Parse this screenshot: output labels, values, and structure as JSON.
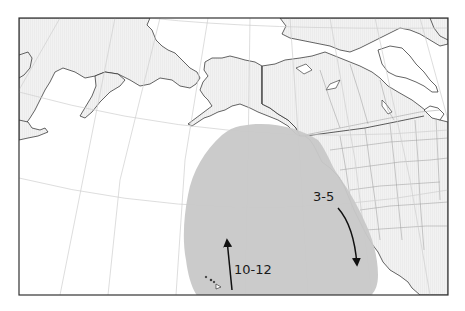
{
  "map": {
    "title": "",
    "regions": [
      "Alaska",
      "Canada",
      "United States",
      "Pacific Ocean",
      "Hawaii",
      "Eastern Siberia"
    ],
    "shaded_area": {
      "description": "Migration range in the North Pacific (gray ellipse)",
      "color": "#c8c8c8"
    },
    "annotations": [
      {
        "id": "south-arrow",
        "label": "3-5",
        "direction": "south",
        "description": "Southward migration along the North American west coast"
      },
      {
        "id": "north-arrow",
        "label": "10-12",
        "direction": "north",
        "description": "Northward migration from near Hawaii"
      }
    ],
    "colors": {
      "land": "#eeeeee",
      "ocean": "#ffffff",
      "coast": "#222222",
      "graticule": "#cccccc",
      "border": "#555555",
      "frame": "#333333"
    }
  }
}
